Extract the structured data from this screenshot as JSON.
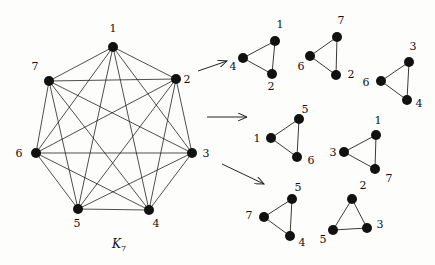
{
  "diagram": {
    "title": "K7",
    "title_sub": "7",
    "graph": {
      "name": "K7",
      "nodes": [
        {
          "id": "1",
          "x": 113,
          "y": 47,
          "lx": 113,
          "ly": 32
        },
        {
          "id": "2",
          "x": 176,
          "y": 79,
          "lx": 187,
          "ly": 83
        },
        {
          "id": "3",
          "x": 192,
          "y": 153,
          "lx": 206,
          "ly": 157
        },
        {
          "id": "4",
          "x": 149,
          "y": 210,
          "lx": 156,
          "ly": 227
        },
        {
          "id": "5",
          "x": 78,
          "y": 209,
          "lx": 77,
          "ly": 227
        },
        {
          "id": "6",
          "x": 36,
          "y": 153,
          "lx": 19,
          "ly": 157
        },
        {
          "id": "7",
          "x": 49,
          "y": 81,
          "lx": 35,
          "ly": 70
        }
      ]
    },
    "arrows": [
      {
        "x1": 198,
        "y1": 71,
        "x2": 227,
        "y2": 61
      },
      {
        "x1": 207,
        "y1": 117,
        "x2": 247,
        "y2": 117
      },
      {
        "x1": 222,
        "y1": 164,
        "x2": 264,
        "y2": 184
      }
    ],
    "triangles": [
      {
        "nodes": [
          {
            "id": "1",
            "x": 275,
            "y": 41,
            "lx": 280,
            "ly": 28
          },
          {
            "id": "4",
            "x": 243,
            "y": 58,
            "lx": 233,
            "ly": 70
          },
          {
            "id": "2",
            "x": 272,
            "y": 74,
            "lx": 271,
            "ly": 90
          }
        ]
      },
      {
        "nodes": [
          {
            "id": "7",
            "x": 337,
            "y": 37,
            "lx": 341,
            "ly": 24
          },
          {
            "id": "6",
            "x": 310,
            "y": 56,
            "lx": 301,
            "ly": 70
          },
          {
            "id": "2",
            "x": 336,
            "y": 75,
            "lx": 351,
            "ly": 78
          }
        ]
      },
      {
        "nodes": [
          {
            "id": "3",
            "x": 409,
            "y": 62,
            "lx": 413,
            "ly": 50
          },
          {
            "id": "6",
            "x": 381,
            "y": 81,
            "lx": 366,
            "ly": 86
          },
          {
            "id": "4",
            "x": 407,
            "y": 100,
            "lx": 419,
            "ly": 107
          }
        ]
      },
      {
        "nodes": [
          {
            "id": "5",
            "x": 299,
            "y": 119,
            "lx": 305,
            "ly": 113
          },
          {
            "id": "1",
            "x": 271,
            "y": 138,
            "lx": 257,
            "ly": 142
          },
          {
            "id": "6",
            "x": 297,
            "y": 157,
            "lx": 311,
            "ly": 164
          }
        ]
      },
      {
        "nodes": [
          {
            "id": "1",
            "x": 376,
            "y": 135,
            "lx": 378,
            "ly": 124
          },
          {
            "id": "3",
            "x": 344,
            "y": 152,
            "lx": 333,
            "ly": 156
          },
          {
            "id": "7",
            "x": 375,
            "y": 169,
            "lx": 389,
            "ly": 182
          }
        ]
      },
      {
        "nodes": [
          {
            "id": "5",
            "x": 292,
            "y": 199,
            "lx": 298,
            "ly": 191
          },
          {
            "id": "7",
            "x": 264,
            "y": 217,
            "lx": 249,
            "ly": 219
          },
          {
            "id": "4",
            "x": 290,
            "y": 236,
            "lx": 302,
            "ly": 246
          }
        ]
      },
      {
        "nodes": [
          {
            "id": "2",
            "x": 352,
            "y": 199,
            "lx": 363,
            "ly": 189
          },
          {
            "id": "5",
            "x": 333,
            "y": 230,
            "lx": 323,
            "ly": 243
          },
          {
            "id": "3",
            "x": 367,
            "y": 228,
            "lx": 380,
            "ly": 228
          }
        ]
      }
    ]
  }
}
